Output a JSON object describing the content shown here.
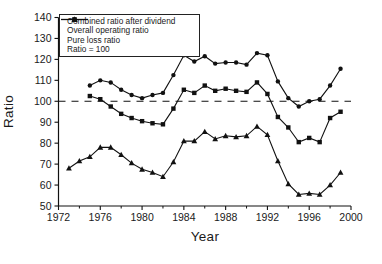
{
  "figure": {
    "background": "#ffffff",
    "ink_color": "#111111"
  },
  "chart_data": {
    "type": "line",
    "title": "",
    "xlabel": "Year",
    "ylabel": "Ratio",
    "xlim": [
      1972,
      2000
    ],
    "ylim": [
      50,
      140
    ],
    "x_major_ticks": [
      1972,
      1976,
      1980,
      1984,
      1988,
      1992,
      1996,
      2000
    ],
    "x_minor_ticks": [
      1974,
      1978,
      1982,
      1986,
      1990,
      1994,
      1998
    ],
    "y_ticks": [
      50,
      60,
      70,
      80,
      90,
      100,
      110,
      120,
      130,
      140
    ],
    "grid": false,
    "legend_position": "top-left",
    "line_color": "#111111",
    "ref_line": {
      "label": "Ratio = 100",
      "value": 100,
      "style": "dashed"
    },
    "series": [
      {
        "name": "Combined ratio after dividend",
        "marker": "circle",
        "x": [
          1975,
          1976,
          1977,
          1978,
          1979,
          1980,
          1981,
          1982,
          1983,
          1984,
          1985,
          1986,
          1987,
          1988,
          1989,
          1990,
          1991,
          1992,
          1993,
          1994,
          1995,
          1996,
          1997,
          1998,
          1999
        ],
        "values": [
          107.5,
          110,
          109,
          105.5,
          103,
          101.5,
          103,
          104,
          112.5,
          122,
          119,
          121.5,
          118,
          118.5,
          118.5,
          117.5,
          123,
          122,
          109.5,
          101.5,
          97.5,
          100,
          101,
          107.5,
          115.5
        ]
      },
      {
        "name": "Overall operating ratio",
        "marker": "square",
        "x": [
          1975,
          1976,
          1977,
          1978,
          1979,
          1980,
          1981,
          1982,
          1983,
          1984,
          1985,
          1986,
          1987,
          1988,
          1989,
          1990,
          1991,
          1992,
          1993,
          1994,
          1995,
          1996,
          1997,
          1998,
          1999
        ],
        "values": [
          102.5,
          101,
          97.5,
          94,
          92,
          90.5,
          89.5,
          89,
          96.5,
          105.5,
          104,
          107.5,
          105,
          106,
          105,
          104.5,
          109,
          103.5,
          92.5,
          87.5,
          80.5,
          82.5,
          80.5,
          92,
          95
        ]
      },
      {
        "name": "Pure loss ratio",
        "marker": "triangle",
        "x": [
          1973,
          1974,
          1975,
          1976,
          1977,
          1978,
          1979,
          1980,
          1981,
          1982,
          1983,
          1984,
          1985,
          1986,
          1987,
          1988,
          1989,
          1990,
          1991,
          1992,
          1993,
          1994,
          1995,
          1996,
          1997,
          1998,
          1999
        ],
        "values": [
          68,
          71.5,
          73.5,
          78,
          78,
          74.5,
          70.5,
          67.5,
          66,
          64,
          71,
          81,
          81,
          85.5,
          82,
          83.5,
          83,
          83.5,
          88,
          84,
          71.5,
          60.5,
          55.5,
          56,
          55.5,
          60,
          66
        ]
      }
    ]
  }
}
